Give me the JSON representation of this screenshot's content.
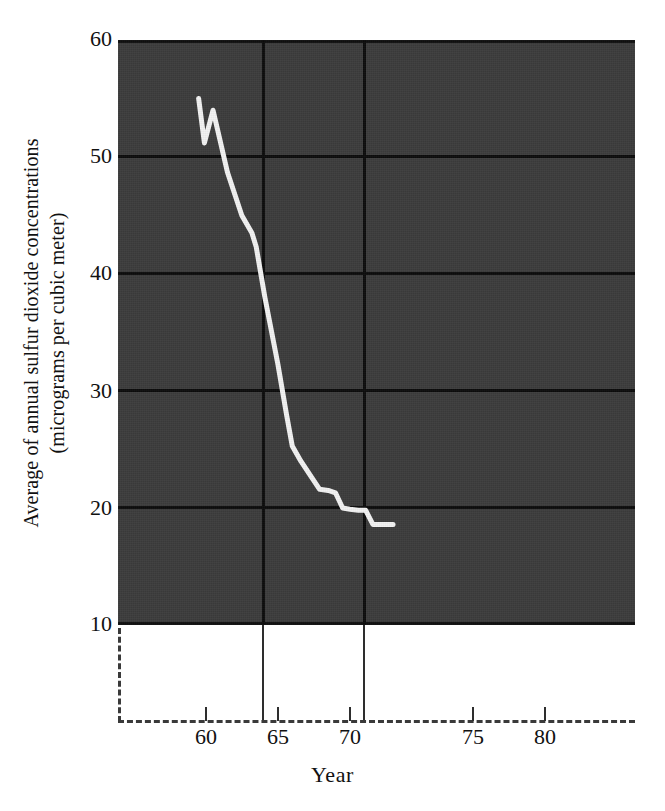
{
  "chart_data": {
    "type": "line",
    "title": "",
    "xlabel": "Year",
    "ylabel": "Average of annual sulfur dioxide concentrations (micrograms per cubic meter)",
    "ylabel_line1": "Average of annual sulfur dioxide concentrations",
    "ylabel_line2": "(micrograms per cubic meter)",
    "xlim": [
      55.5,
      84.0
    ],
    "ylim": [
      10,
      60
    ],
    "panel_xlim": [
      59.0,
      94.9
    ],
    "grid": "horizontal-and-vertical-reference",
    "legend": "none",
    "yticks": [
      60,
      50,
      40,
      30,
      20,
      10
    ],
    "xticks": [
      60,
      65,
      70,
      75,
      80
    ],
    "gridlines_y": [
      50,
      40,
      30,
      20
    ],
    "reference_years": [
      64,
      71
    ],
    "x": [
      64.6,
      65.0,
      65.6,
      66.6,
      67.6,
      68.3,
      68.6,
      69.2,
      70.1,
      70.7,
      71.1,
      71.7,
      72.4,
      73.0,
      73.6,
      74.1,
      74.6,
      75.1,
      75.7,
      76.2,
      76.7,
      78.1
    ],
    "series": [
      {
        "name": "Average annual sulfur dioxide concentration",
        "color": "#f2f2f2",
        "values": [
          55.0,
          51.2,
          54.0,
          48.7,
          45.0,
          43.5,
          42.3,
          38.0,
          32.3,
          28.0,
          25.3,
          24.0,
          22.7,
          21.6,
          21.5,
          21.3,
          20.0,
          19.9,
          19.8,
          19.8,
          18.6,
          18.6
        ]
      }
    ]
  },
  "axes": {
    "y_tick_labels": [
      "60",
      "50",
      "40",
      "30",
      "20",
      "10"
    ],
    "x_tick_labels": [
      "60",
      "65",
      "70",
      "75",
      "80"
    ],
    "x_title": "Year",
    "y_title_line1": "Average of annual sulfur dioxide concentrations",
    "y_title_line2": "(micrograms per cubic meter)"
  },
  "style": {
    "panel_background": "#3b3b3b",
    "grid_color": "#0b0b0b",
    "line_color": "#f2f2f2",
    "axis_color": "#2e2e2e",
    "page_background": "#ffffff",
    "text_color": "#111111"
  }
}
